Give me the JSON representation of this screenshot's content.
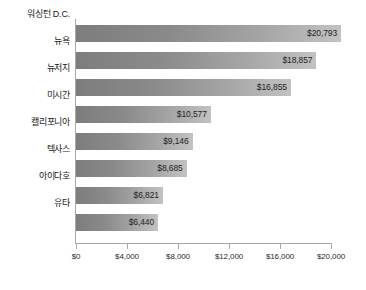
{
  "chart_data": {
    "type": "bar",
    "orientation": "horizontal",
    "title": "",
    "subtitle": "",
    "xlabel": "",
    "ylabel": "",
    "grid": false,
    "legend": null,
    "xlim": [
      0,
      20000
    ],
    "xticks": [
      0,
      4000,
      8000,
      12000,
      16000,
      20000
    ],
    "xtick_labels": [
      "$0",
      "$4,000",
      "$8,000",
      "$12,000",
      "$16,000",
      "$20,000"
    ],
    "categories": [
      "워싱턴 D.C.",
      "뉴욕",
      "뉴저지",
      "미시간",
      "캘리포니아",
      "텍사스",
      "아이다호",
      "유타"
    ],
    "values": [
      20793,
      18857,
      16855,
      10577,
      9146,
      8685,
      6821,
      6440
    ],
    "value_labels": [
      "$20,793",
      "$18,857",
      "$16,855",
      "$10,577",
      "$9,146",
      "$8,685",
      "$6,821",
      "$6,440"
    ],
    "colors": {
      "bar_gradient_start": "#7d7d7d",
      "bar_gradient_end": "#c2c2c2",
      "axis": "#a8a8a8",
      "text": "#1a1a1a",
      "background": "#ffffff"
    }
  }
}
